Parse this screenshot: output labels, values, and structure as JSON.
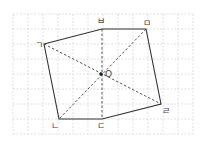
{
  "figure": {
    "title": "",
    "grid": {
      "x0": 13,
      "y0": 14,
      "step": 15,
      "cols": 12,
      "rows": 8
    },
    "center": {
      "label": "O",
      "x": 101,
      "y": 74
    },
    "vertices": [
      {
        "id": "g",
        "label": "ㄱ",
        "x": 44,
        "y": 44,
        "lx": 35,
        "ly": 48
      },
      {
        "id": "b",
        "label": "ㅂ",
        "x": 102,
        "y": 29,
        "lx": 97,
        "ly": 24
      },
      {
        "id": "m",
        "label": "ㅁ",
        "x": 146,
        "y": 29,
        "lx": 143,
        "ly": 26
      },
      {
        "id": "r",
        "label": "ㄹ",
        "x": 161,
        "y": 104,
        "lx": 162,
        "ly": 114
      },
      {
        "id": "d",
        "label": "ㄷ",
        "x": 102,
        "y": 119,
        "lx": 97,
        "ly": 129
      },
      {
        "id": "n",
        "label": "ㄴ",
        "x": 59,
        "y": 119,
        "lx": 51,
        "ly": 129
      }
    ],
    "diagonals": [
      [
        "g",
        "r"
      ],
      [
        "b",
        "d"
      ],
      [
        "m",
        "n"
      ]
    ],
    "colors": {
      "edge": "#333333",
      "grid": "#d4d4d4",
      "diagonal": "#444444"
    }
  }
}
